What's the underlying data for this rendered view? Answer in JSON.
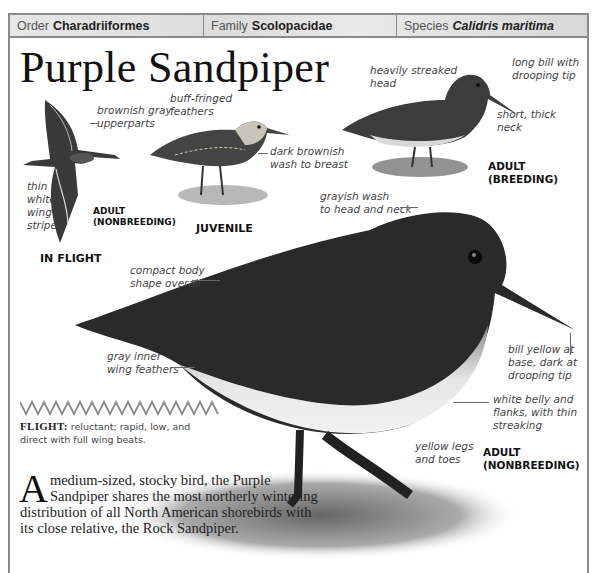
{
  "taxonomy": {
    "order": {
      "label": "Order",
      "value": "Charadriiformes"
    },
    "family": {
      "label": "Family",
      "value": "Scolopacidae"
    },
    "species": {
      "label": "Species",
      "value": "Calidris maritima"
    }
  },
  "title": "Purple Sandpiper",
  "illustrations": {
    "in_flight": {
      "caption": "IN FLIGHT",
      "sub_caption": "ADULT\n(NONBREEDING)",
      "annotations": [
        "brownish gray\nupperparts",
        "thin\nwhite\nwing\nstripe"
      ]
    },
    "juvenile": {
      "caption": "JUVENILE",
      "annotations": [
        "buff-fringed\nfeathers",
        "dark brownish\nwash to breast"
      ]
    },
    "adult_breeding": {
      "caption": "ADULT\n(BREEDING)",
      "annotations": [
        "heavily streaked\nhead",
        "long bill with\ndrooping tip",
        "short, thick\nneck"
      ]
    },
    "adult_nonbreeding": {
      "caption": "ADULT\n(NONBREEDING)",
      "annotations": [
        "grayish wash\nto head and neck",
        "compact body\nshape overall",
        "bill yellow at\nbase, dark at\ndrooping tip",
        "gray inner\nwing feathers",
        "white belly and\nflanks, with thin\nstreaking",
        "yellow legs\nand toes"
      ]
    }
  },
  "flight": {
    "label": "FLIGHT:",
    "description": " reluctant; rapid, low, and direct with full wing beats."
  },
  "description": {
    "dropcap": "A",
    "text": "medium-sized, stocky bird, the Purple Sandpiper shares the most northerly wintering distribution of all North American shorebirds with its close relative, the Rock Sandpiper."
  }
}
